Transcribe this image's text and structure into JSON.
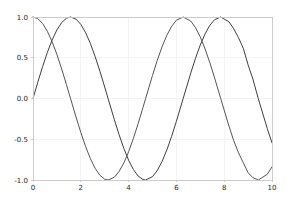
{
  "figure": {
    "background_color": "#ffffff",
    "width": 288,
    "height": 200
  },
  "chart_data": {
    "type": "line",
    "title": "",
    "subtitle": "",
    "xlabel": "",
    "ylabel": "",
    "xlim": [
      0,
      10
    ],
    "ylim": [
      -1.0,
      1.0
    ],
    "grid": true,
    "grid_color": "#f2f0f5",
    "legend": null,
    "legend_position": "none",
    "xticks": [
      0,
      2,
      4,
      6,
      8,
      10
    ],
    "xtick_labels": [
      "0",
      "2",
      "4",
      "6",
      "8",
      "10"
    ],
    "yticks": [
      -1.0,
      -0.5,
      0.0,
      0.5,
      1.0
    ],
    "ytick_labels": [
      "-1.0",
      "-0.5",
      "0.0",
      "0.5",
      "1.0"
    ],
    "series": [
      {
        "name": "sin(x)",
        "color": "#3f3f3f",
        "linewidth": 1.0,
        "x": [
          0.0,
          0.2,
          0.4,
          0.6,
          0.8,
          1.0,
          1.2,
          1.4,
          1.5708,
          1.8,
          2.0,
          2.2,
          2.4,
          2.6,
          2.8,
          3.0,
          3.1416,
          3.4,
          3.6,
          3.8,
          4.0,
          4.2,
          4.4,
          4.6,
          4.7124,
          5.0,
          5.2,
          5.4,
          5.6,
          5.8,
          6.0,
          6.2832,
          6.6,
          6.8,
          7.0,
          7.2,
          7.4,
          7.6,
          7.854,
          8.2,
          8.4,
          8.6,
          8.8,
          9.0,
          9.2,
          9.4248,
          9.8,
          10.0
        ],
        "y": [
          0.0,
          0.1987,
          0.3894,
          0.5646,
          0.7174,
          0.8415,
          0.932,
          0.9854,
          1.0,
          0.9738,
          0.9093,
          0.8085,
          0.6755,
          0.5155,
          0.335,
          0.1411,
          0.0,
          -0.2555,
          -0.4425,
          -0.6119,
          -0.7568,
          -0.8716,
          -0.9516,
          -0.9937,
          -1.0,
          -0.9589,
          -0.8835,
          -0.7728,
          -0.6313,
          -0.4646,
          -0.2794,
          0.0,
          0.3115,
          0.4941,
          0.657,
          0.7937,
          0.8987,
          0.9679,
          1.0,
          0.9407,
          0.8546,
          0.7451,
          0.6154,
          0.4121,
          0.2392,
          0.0,
          -0.3665,
          -0.544
        ]
      },
      {
        "name": "cos(x)",
        "color": "#555555",
        "linewidth": 1.0,
        "x": [
          0.0,
          0.2,
          0.4,
          0.6,
          0.8,
          1.0,
          1.2,
          1.4,
          1.5708,
          1.8,
          2.0,
          2.2,
          2.4,
          2.6,
          2.8,
          3.0,
          3.1416,
          3.4,
          3.6,
          3.8,
          4.0,
          4.2,
          4.4,
          4.6,
          4.7124,
          5.0,
          5.2,
          5.4,
          5.6,
          5.8,
          6.0,
          6.2832,
          6.6,
          6.8,
          7.0,
          7.2,
          7.4,
          7.6,
          7.854,
          8.2,
          8.4,
          8.6,
          8.8,
          9.0,
          9.2,
          9.4248,
          9.8,
          10.0
        ],
        "y": [
          1.0,
          0.9801,
          0.9211,
          0.8253,
          0.6967,
          0.5403,
          0.3624,
          0.17,
          0.0,
          -0.2272,
          -0.4161,
          -0.5885,
          -0.7374,
          -0.8569,
          -0.9422,
          -0.99,
          -1.0,
          -0.9668,
          -0.8968,
          -0.791,
          -0.6536,
          -0.4903,
          -0.3073,
          -0.1122,
          0.0,
          0.2837,
          0.4685,
          0.6347,
          0.7756,
          0.8855,
          0.9602,
          1.0,
          0.9502,
          0.8694,
          0.7539,
          0.6084,
          0.4385,
          0.2513,
          0.0,
          -0.3392,
          -0.5193,
          -0.6669,
          -0.7883,
          -0.9111,
          -0.971,
          -1.0,
          -0.9305,
          -0.8391
        ]
      }
    ]
  }
}
